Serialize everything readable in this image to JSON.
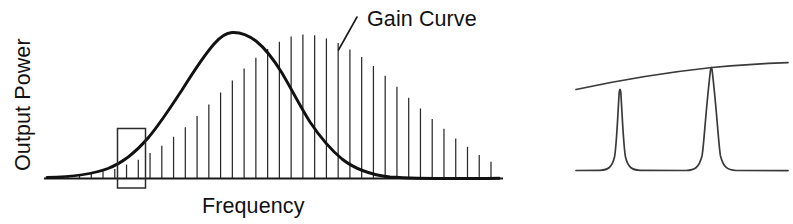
{
  "figure": {
    "background_color": "#ffffff",
    "ink_color": "#111111"
  },
  "axes": {
    "y_label": "Output Power",
    "x_label": "Frequency"
  },
  "annotations": {
    "gain_curve_label": "Gain Curve",
    "leader_line": true,
    "highlight_box": true
  },
  "chart_data": {
    "type": "area",
    "title": "Gain Curve",
    "xlabel": "Frequency",
    "ylabel": "Output Power",
    "grid": false,
    "legend": "none",
    "panels": [
      {
        "name": "gain-curve-panel",
        "description": "Broad gain bandwidth envelope with vertical longitudinal mode lines drawn from the frequency axis up to the gain curve, and a rectangular callout box marking one small group of modes on the rising edge.",
        "curve_shape": "gaussian",
        "x": [
          0,
          5,
          10,
          15,
          20,
          25,
          30,
          35,
          40,
          45,
          50,
          55,
          60,
          65,
          70,
          75,
          80,
          85,
          90,
          95,
          100
        ],
        "y": [
          0.01,
          0.02,
          0.04,
          0.07,
          0.13,
          0.22,
          0.34,
          0.49,
          0.65,
          0.81,
          0.93,
          1.0,
          0.99,
          0.93,
          0.83,
          0.7,
          0.55,
          0.41,
          0.28,
          0.17,
          0.08
        ],
        "peak_x": 55,
        "peak_y": 1.0,
        "mode_line_count": 38,
        "highlight_box_range_x": [
          16,
          24
        ]
      },
      {
        "name": "mode-detail-panel",
        "description": "Magnified detail of the boxed region: two narrow longitudinal mode resonance peaks rising to touch the locally linear, gently upward-sloping gain envelope.",
        "curve_shape": "two-lorentzian-peaks",
        "peak_positions": [
          0.21,
          0.64
        ],
        "peak_heights": [
          1.0,
          1.0
        ],
        "envelope_slope": "rising-left-to-right",
        "envelope_y_left": 0.78,
        "envelope_y_right": 1.04,
        "baseline_y": 0.0
      }
    ]
  }
}
